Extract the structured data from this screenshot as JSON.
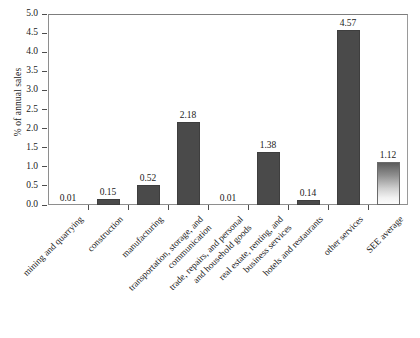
{
  "chart_data": {
    "type": "bar",
    "title": "",
    "xlabel": "",
    "ylabel": "% of annual sales",
    "ylim": [
      0.0,
      5.0
    ],
    "ytick_step": 0.5,
    "grid": false,
    "legend": "none",
    "bar_color": "#4a4a4a",
    "highlight_bar_color_top": "#5c5c5c",
    "highlight_bar_color_bottom": "#fbfbfb",
    "categories": [
      "mining and quarrying",
      "construction",
      "manufacturing",
      "transportation, storage, and communication",
      "trade, repairs, and personal and household goods",
      "real estate, renting, and business services",
      "hotels and restaurants",
      "other services",
      "SEE average"
    ],
    "values": [
      0.01,
      0.15,
      0.52,
      2.18,
      0.01,
      1.38,
      0.14,
      4.57,
      1.12
    ],
    "value_labels": [
      "0.01",
      "0.15",
      "0.52",
      "2.18",
      "0.01",
      "1.38",
      "0.14",
      "4.57",
      "1.12"
    ],
    "ytick_labels": [
      "0.0",
      "0.5",
      "1.0",
      "1.5",
      "2.0",
      "2.5",
      "3.0",
      "3.5",
      "4.0",
      "4.5",
      "5.0"
    ],
    "category_lines": [
      [
        "mining and quarrying"
      ],
      [
        "construction"
      ],
      [
        "manufacturing"
      ],
      [
        "transportation, storage, and",
        "communication"
      ],
      [
        "trade, repairs, and personal",
        "and household goods"
      ],
      [
        "real estate, renting, and",
        "business services"
      ],
      [
        "hotels and restaurants"
      ],
      [
        "other services"
      ],
      [
        "SEE average"
      ]
    ]
  }
}
